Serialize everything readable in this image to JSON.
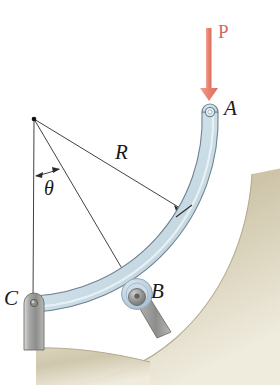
{
  "figure": {
    "background_color": "#ffffff"
  },
  "labels": {
    "point_a": "A",
    "point_b": "B",
    "point_c": "C",
    "radius": "R",
    "angle": "θ",
    "load": "P"
  },
  "colors": {
    "load_arrow": "#e8806e",
    "load_text": "#cf6a5e",
    "bar_fill": "#ccdce6",
    "bar_fill_light": "#e3eef4",
    "bar_outline": "#6f8590",
    "ground_fill": "#cfc6ab",
    "ground_fill_light": "#e6e0cd",
    "support_metal": "#9a9a98",
    "line_color": "#2b2b2b",
    "roller_blue": "#b9cede"
  },
  "geometry": {
    "arc_center": {
      "x": 34,
      "y": 119
    },
    "arc_radius": 185,
    "point_a": {
      "x": 210,
      "y": 112
    },
    "point_b": {
      "x": 137,
      "y": 297
    },
    "point_c": {
      "x": 33,
      "y": 303
    },
    "radius_arrow_tip": {
      "x": 183,
      "y": 211
    },
    "load_arrow_start": {
      "x": 209,
      "y": 28
    },
    "load_arrow_tip": {
      "x": 209,
      "y": 100
    },
    "theta_arc_y": 175
  },
  "icons": {
    "load_arrow": "down-arrow-icon",
    "pin_support": "pin-support-icon",
    "roller_support": "roller-support-icon",
    "center_dot": "arc-center-dot-icon",
    "radius_leader": "radius-leader-line-icon",
    "angle_arc": "angle-arc-icon"
  }
}
